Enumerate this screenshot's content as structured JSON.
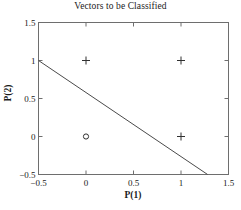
{
  "chart_data": {
    "type": "scatter",
    "title": "Vectors to be Classified",
    "xlabel": "P(1)",
    "ylabel": "P(2)",
    "xlim": [
      -0.5,
      1.5
    ],
    "ylim": [
      -0.5,
      1.5
    ],
    "xticks": [
      -0.5,
      0,
      0.5,
      1,
      1.5
    ],
    "xtick_labels": [
      "−0.5",
      "0",
      "0.5",
      "1",
      "1.5"
    ],
    "yticks": [
      -0.5,
      0,
      0.5,
      1,
      1.5
    ],
    "ytick_labels": [
      "−0.5",
      "0",
      "0.5",
      "1",
      "1.5"
    ],
    "grid": false,
    "legend": null,
    "series": [
      {
        "name": "class-plus",
        "marker": "+",
        "color": "#303030",
        "points": [
          {
            "x": 0,
            "y": 1
          },
          {
            "x": 1,
            "y": 1
          },
          {
            "x": 1,
            "y": 0
          }
        ]
      },
      {
        "name": "class-circle",
        "marker": "o",
        "color": "#303030",
        "points": [
          {
            "x": 0,
            "y": 0
          }
        ]
      }
    ],
    "lines": [
      {
        "name": "decision-boundary",
        "color": "#4a4a4a",
        "x": [
          -0.5,
          1.28
        ],
        "y": [
          1.0,
          -0.5
        ]
      }
    ]
  },
  "axes": {
    "box_color": "#6e6e6e",
    "tick_direction": "in"
  }
}
